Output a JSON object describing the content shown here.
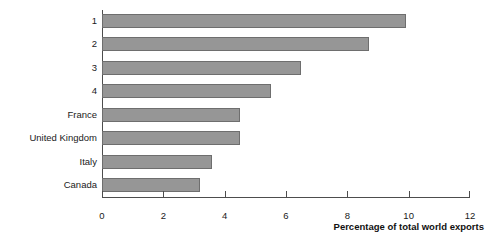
{
  "chart_data": {
    "type": "bar",
    "orientation": "horizontal",
    "title": "",
    "xlabel": "Percentage of total world exports",
    "ylabel": "",
    "categories": [
      "1",
      "2",
      "3",
      "4",
      "France",
      "United Kingdom",
      "Italy",
      "Canada"
    ],
    "values": [
      9.9,
      8.7,
      6.5,
      5.5,
      4.5,
      4.5,
      3.6,
      3.2
    ],
    "xlim": [
      0,
      12
    ],
    "xticks": [
      0,
      2,
      4,
      6,
      8,
      10,
      12
    ],
    "xtick_labels": [
      "0",
      "2",
      "4",
      "6",
      "8",
      "10",
      "12"
    ],
    "grid": false,
    "legend": false,
    "bar_color": "#969696",
    "bar_border_color": "#6e6e6e",
    "axis_color": "#4d4d4d"
  }
}
